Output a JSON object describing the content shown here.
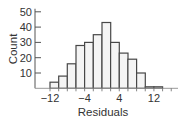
{
  "chart_data": {
    "type": "bar",
    "subtype": "histogram",
    "title": "",
    "xlabel": "Residuals",
    "ylabel": "Count",
    "bin_width": 2,
    "bins": [
      {
        "start": -12,
        "end": -10,
        "count": 4
      },
      {
        "start": -10,
        "end": -8,
        "count": 8
      },
      {
        "start": -8,
        "end": -6,
        "count": 16
      },
      {
        "start": -6,
        "end": -4,
        "count": 28
      },
      {
        "start": -4,
        "end": -2,
        "count": 30
      },
      {
        "start": -2,
        "end": 0,
        "count": 35
      },
      {
        "start": 0,
        "end": 2,
        "count": 43
      },
      {
        "start": 2,
        "end": 4,
        "count": 30
      },
      {
        "start": 4,
        "end": 6,
        "count": 23
      },
      {
        "start": 6,
        "end": 8,
        "count": 19
      },
      {
        "start": 8,
        "end": 10,
        "count": 10
      },
      {
        "start": 10,
        "end": 12,
        "count": 1
      },
      {
        "start": 12,
        "end": 14,
        "count": 1
      }
    ],
    "categories": [
      "-12",
      "-10",
      "-8",
      "-6",
      "-4",
      "-2",
      "0",
      "2",
      "4",
      "6",
      "8",
      "10",
      "12"
    ],
    "values": [
      4,
      8,
      16,
      28,
      30,
      35,
      43,
      30,
      23,
      19,
      10,
      1,
      1
    ],
    "x_ticks": [
      -12,
      -4,
      4,
      12
    ],
    "x_tick_labels": [
      "−12",
      "−4",
      "4",
      "12"
    ],
    "y_ticks": [
      10,
      20,
      30,
      40,
      50
    ],
    "y_tick_labels": [
      "10",
      "20",
      "30",
      "40",
      "50"
    ],
    "xlim": [
      -12,
      17
    ],
    "ylim": [
      0,
      50
    ],
    "grid": false,
    "legend": null,
    "colors": {
      "bar_fill": "#f4f4f4",
      "bar_stroke": "#474747",
      "axis": "#555555",
      "text": "#333333"
    }
  }
}
